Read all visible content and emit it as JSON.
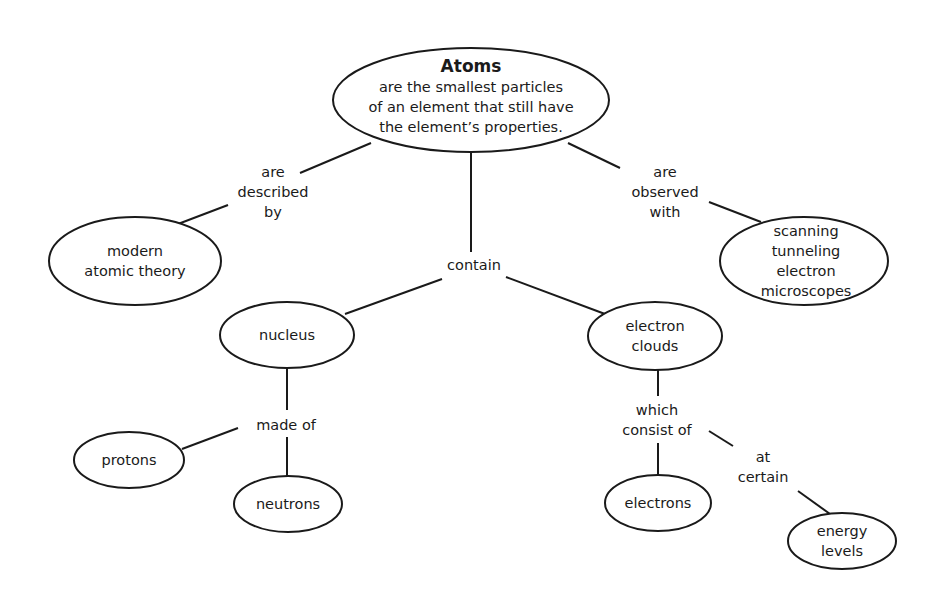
{
  "diagram": {
    "type": "concept-map",
    "stroke_color": "#1a1a1a",
    "background": "#ffffff",
    "root": {
      "title": "Atoms",
      "description": "are the smallest particles\nof an element that still have\nthe element’s properties."
    },
    "nodes": {
      "modern_atomic_theory": "modern\natomic theory",
      "stm": "scanning\ntunneling electron\nmicroscopes",
      "nucleus": "nucleus",
      "electron_clouds": "electron\nclouds",
      "protons": "protons",
      "neutrons": "neutrons",
      "electrons": "electrons",
      "energy_levels": "energy\nlevels"
    },
    "linking_phrases": {
      "described_by": "are\ndescribed\nby",
      "observed_with": "are\nobserved\nwith",
      "contain": "contain",
      "made_of": "made of",
      "consist_of": "which\nconsist of",
      "at_certain": "at\ncertain"
    }
  }
}
